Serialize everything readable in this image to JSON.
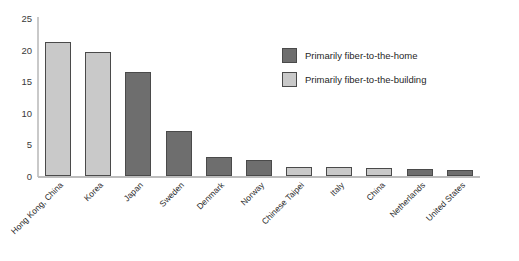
{
  "chart_data": {
    "type": "bar",
    "title": "",
    "subtitle": "",
    "xlabel": "",
    "ylabel": "",
    "ylim": [
      0,
      25
    ],
    "yticks": [
      0,
      5,
      10,
      15,
      20,
      25
    ],
    "grid": false,
    "legend_position": "inside-top-right",
    "categories": [
      "Hong Kong, China",
      "Korea",
      "Japan",
      "Sweden",
      "Denmark",
      "Norway",
      "Chinese Taipei",
      "Italy",
      "China",
      "Netherlands",
      "United States"
    ],
    "values": [
      21.2,
      19.7,
      16.4,
      7.2,
      3.0,
      2.6,
      1.5,
      1.4,
      1.2,
      1.1,
      1.0
    ],
    "point_categories": [
      "building",
      "building",
      "home",
      "home",
      "home",
      "home",
      "building",
      "building",
      "building",
      "home",
      "home"
    ],
    "series": [
      {
        "name": "Primarily fiber-to-the-home",
        "key": "home",
        "color": "#6e6e6e",
        "values": [
          null,
          null,
          16.4,
          7.2,
          3.0,
          2.6,
          null,
          null,
          null,
          1.1,
          1.0
        ]
      },
      {
        "name": "Primarily fiber-to-the-building",
        "key": "building",
        "color": "#c9c9c9",
        "values": [
          21.2,
          19.7,
          null,
          null,
          null,
          null,
          1.5,
          1.4,
          1.2,
          null,
          null
        ]
      }
    ]
  },
  "legend": {
    "items": [
      {
        "label": "Primarily fiber-to-the-home",
        "key": "home"
      },
      {
        "label": "Primarily fiber-to-the-building",
        "key": "building"
      }
    ]
  },
  "colors": {
    "fiber_to_the_home": "#6e6e6e",
    "fiber_to_the_building": "#c9c9c9",
    "bar_border": "#4a4a4a",
    "axis": "#c9c9c9",
    "text": "#2b2b2b",
    "background": "#ffffff"
  }
}
